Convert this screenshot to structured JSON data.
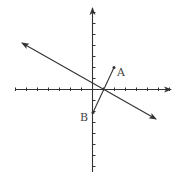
{
  "diagram": {
    "type": "coordinate-plane",
    "origin_px": [
      92.5,
      89.5
    ],
    "unit_px": 11,
    "axes": {
      "x": {
        "from": [
          16,
          89.5
        ],
        "to": [
          171,
          89.5
        ],
        "arrow": "right",
        "ticks_neg": 7,
        "ticks_pos": 7
      },
      "y": {
        "from": [
          92.5,
          172
        ],
        "to": [
          92.5,
          8
        ],
        "arrow": "up",
        "ticks_neg": 7,
        "ticks_pos": 7
      }
    },
    "line": {
      "description": "line with arrows at both ends",
      "from": [
        22,
        43
      ],
      "to": [
        156,
        119
      ]
    },
    "segment": {
      "description": "segment AB",
      "A": [
        114,
        67.5
      ],
      "B": [
        93,
        112.5
      ]
    },
    "points": [
      {
        "name": "A",
        "label": "A",
        "px": [
          114,
          67.5
        ],
        "label_px": [
          117,
          76
        ]
      },
      {
        "name": "B",
        "label": "B",
        "px": [
          93,
          112.5
        ],
        "label_px": [
          80,
          121
        ]
      }
    ],
    "colors": {
      "stroke": "#333333",
      "label": "#444444",
      "background": "#ffffff"
    }
  }
}
